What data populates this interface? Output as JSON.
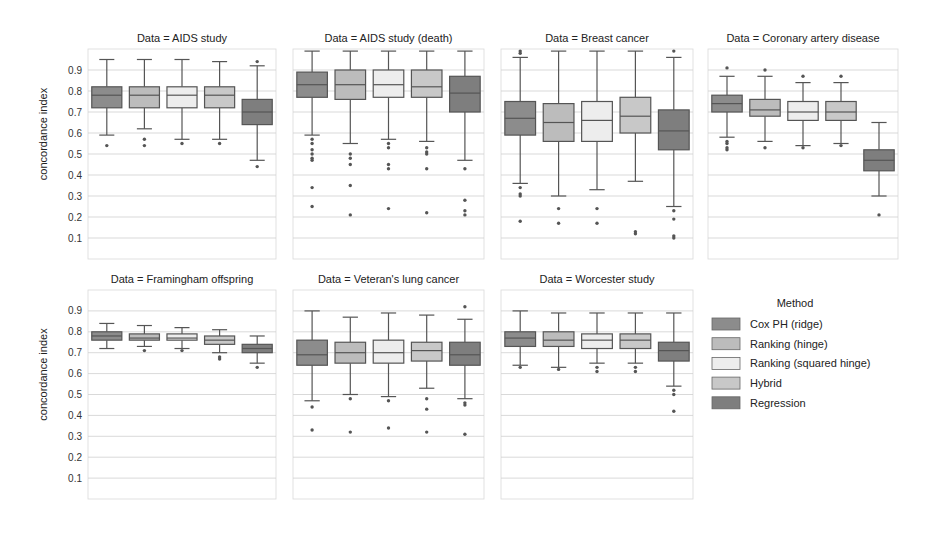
{
  "chart_data": {
    "type": "box",
    "ylabel": "concordance index",
    "ylim": [
      0.0,
      1.0
    ],
    "yticks": [
      0.1,
      0.2,
      0.3,
      0.4,
      0.5,
      0.6,
      0.7,
      0.8,
      0.9
    ],
    "ytick_labels": [
      "0.1",
      "0.2",
      "0.3",
      "0.4",
      "0.5",
      "0.6",
      "0.7",
      "0.8",
      "0.9"
    ],
    "grid": true,
    "legend": {
      "title": "Method",
      "placement": "right",
      "entries": [
        {
          "name": "Cox PH (ridge)",
          "color": "#8c8c8c"
        },
        {
          "name": "Ranking (hinge)",
          "color": "#bcbcbc"
        },
        {
          "name": "Ranking (squared hinge)",
          "color": "#ededed"
        },
        {
          "name": "Hybrid",
          "color": "#c8c8c8"
        },
        {
          "name": "Regression",
          "color": "#7e7e7e"
        }
      ]
    },
    "panels": [
      {
        "title": "Data = AIDS study",
        "boxes": [
          {
            "method": "Cox PH (ridge)",
            "whislo": 0.59,
            "q1": 0.72,
            "med": 0.78,
            "q3": 0.82,
            "whishi": 0.95,
            "fliers": [
              0.54
            ]
          },
          {
            "method": "Ranking (hinge)",
            "whislo": 0.62,
            "q1": 0.72,
            "med": 0.78,
            "q3": 0.82,
            "whishi": 0.95,
            "fliers": [
              0.57,
              0.54
            ]
          },
          {
            "method": "Ranking (squared hinge)",
            "whislo": 0.57,
            "q1": 0.72,
            "med": 0.78,
            "q3": 0.82,
            "whishi": 0.95,
            "fliers": [
              0.55
            ]
          },
          {
            "method": "Hybrid",
            "whislo": 0.57,
            "q1": 0.72,
            "med": 0.78,
            "q3": 0.82,
            "whishi": 0.94,
            "fliers": [
              0.55
            ]
          },
          {
            "method": "Regression",
            "whislo": 0.47,
            "q1": 0.64,
            "med": 0.7,
            "q3": 0.76,
            "whishi": 0.92,
            "fliers": [
              0.94,
              0.44
            ]
          }
        ]
      },
      {
        "title": "Data = AIDS study (death)",
        "boxes": [
          {
            "method": "Cox PH (ridge)",
            "whislo": 0.59,
            "q1": 0.77,
            "med": 0.83,
            "q3": 0.89,
            "whishi": 0.99,
            "fliers": [
              0.57,
              0.55,
              0.52,
              0.5,
              0.48,
              0.47,
              0.34,
              0.25
            ]
          },
          {
            "method": "Ranking (hinge)",
            "whislo": 0.55,
            "q1": 0.76,
            "med": 0.83,
            "q3": 0.9,
            "whishi": 0.99,
            "fliers": [
              0.5,
              0.48,
              0.45,
              0.35,
              0.21
            ]
          },
          {
            "method": "Ranking (squared hinge)",
            "whislo": 0.57,
            "q1": 0.77,
            "med": 0.83,
            "q3": 0.9,
            "whishi": 0.99,
            "fliers": [
              0.55,
              0.53,
              0.45,
              0.43,
              0.24
            ]
          },
          {
            "method": "Hybrid",
            "whislo": 0.56,
            "q1": 0.77,
            "med": 0.82,
            "q3": 0.9,
            "whishi": 0.99,
            "fliers": [
              0.53,
              0.51,
              0.5,
              0.43,
              0.22
            ]
          },
          {
            "method": "Regression",
            "whislo": 0.47,
            "q1": 0.7,
            "med": 0.79,
            "q3": 0.87,
            "whishi": 0.99,
            "fliers": [
              0.43,
              0.28,
              0.23,
              0.21
            ]
          }
        ]
      },
      {
        "title": "Data = Breast cancer",
        "boxes": [
          {
            "method": "Cox PH (ridge)",
            "whislo": 0.36,
            "q1": 0.59,
            "med": 0.67,
            "q3": 0.75,
            "whishi": 0.96,
            "fliers": [
              0.99,
              0.98,
              0.34,
              0.31,
              0.3,
              0.18
            ]
          },
          {
            "method": "Ranking (hinge)",
            "whislo": 0.3,
            "q1": 0.56,
            "med": 0.65,
            "q3": 0.74,
            "whishi": 0.99,
            "fliers": [
              0.24,
              0.17
            ]
          },
          {
            "method": "Ranking (squared hinge)",
            "whislo": 0.33,
            "q1": 0.56,
            "med": 0.66,
            "q3": 0.75,
            "whishi": 0.99,
            "fliers": [
              0.24,
              0.17
            ]
          },
          {
            "method": "Hybrid",
            "whislo": 0.37,
            "q1": 0.6,
            "med": 0.68,
            "q3": 0.77,
            "whishi": 0.99,
            "fliers": [
              0.13,
              0.12
            ]
          },
          {
            "method": "Regression",
            "whislo": 0.25,
            "q1": 0.52,
            "med": 0.61,
            "q3": 0.71,
            "whishi": 0.96,
            "fliers": [
              0.99,
              0.23,
              0.19,
              0.11,
              0.1
            ]
          }
        ]
      },
      {
        "title": "Data = Coronary artery disease",
        "boxes": [
          {
            "method": "Cox PH (ridge)",
            "whislo": 0.58,
            "q1": 0.7,
            "med": 0.74,
            "q3": 0.78,
            "whishi": 0.87,
            "fliers": [
              0.91,
              0.56,
              0.55,
              0.53,
              0.52
            ]
          },
          {
            "method": "Ranking (hinge)",
            "whislo": 0.56,
            "q1": 0.68,
            "med": 0.71,
            "q3": 0.76,
            "whishi": 0.87,
            "fliers": [
              0.9,
              0.53
            ]
          },
          {
            "method": "Ranking (squared hinge)",
            "whislo": 0.54,
            "q1": 0.66,
            "med": 0.7,
            "q3": 0.75,
            "whishi": 0.84,
            "fliers": [
              0.87,
              0.53
            ]
          },
          {
            "method": "Hybrid",
            "whislo": 0.55,
            "q1": 0.66,
            "med": 0.7,
            "q3": 0.75,
            "whishi": 0.84,
            "fliers": [
              0.87,
              0.54
            ]
          },
          {
            "method": "Regression",
            "whislo": 0.3,
            "q1": 0.42,
            "med": 0.47,
            "q3": 0.52,
            "whishi": 0.65,
            "fliers": [
              0.21
            ]
          }
        ]
      },
      {
        "title": "Data = Framingham offspring",
        "boxes": [
          {
            "method": "Cox PH (ridge)",
            "whislo": 0.72,
            "q1": 0.76,
            "med": 0.78,
            "q3": 0.8,
            "whishi": 0.84,
            "fliers": []
          },
          {
            "method": "Ranking (hinge)",
            "whislo": 0.73,
            "q1": 0.76,
            "med": 0.77,
            "q3": 0.79,
            "whishi": 0.83,
            "fliers": [
              0.71
            ]
          },
          {
            "method": "Ranking (squared hinge)",
            "whislo": 0.72,
            "q1": 0.76,
            "med": 0.77,
            "q3": 0.79,
            "whishi": 0.82,
            "fliers": [
              0.71
            ]
          },
          {
            "method": "Hybrid",
            "whislo": 0.7,
            "q1": 0.74,
            "med": 0.76,
            "q3": 0.78,
            "whishi": 0.81,
            "fliers": [
              0.68,
              0.67
            ]
          },
          {
            "method": "Regression",
            "whislo": 0.65,
            "q1": 0.7,
            "med": 0.72,
            "q3": 0.74,
            "whishi": 0.78,
            "fliers": [
              0.63
            ]
          }
        ]
      },
      {
        "title": "Data = Veteran's lung cancer",
        "boxes": [
          {
            "method": "Cox PH (ridge)",
            "whislo": 0.47,
            "q1": 0.64,
            "med": 0.69,
            "q3": 0.76,
            "whishi": 0.9,
            "fliers": [
              0.44,
              0.33
            ]
          },
          {
            "method": "Ranking (hinge)",
            "whislo": 0.5,
            "q1": 0.65,
            "med": 0.7,
            "q3": 0.75,
            "whishi": 0.87,
            "fliers": [
              0.48,
              0.32
            ]
          },
          {
            "method": "Ranking (squared hinge)",
            "whislo": 0.49,
            "q1": 0.65,
            "med": 0.7,
            "q3": 0.76,
            "whishi": 0.89,
            "fliers": [
              0.47,
              0.34
            ]
          },
          {
            "method": "Hybrid",
            "whislo": 0.53,
            "q1": 0.66,
            "med": 0.71,
            "q3": 0.75,
            "whishi": 0.88,
            "fliers": [
              0.48,
              0.43,
              0.32
            ]
          },
          {
            "method": "Regression",
            "whislo": 0.48,
            "q1": 0.64,
            "med": 0.69,
            "q3": 0.75,
            "whishi": 0.86,
            "fliers": [
              0.92,
              0.46,
              0.45,
              0.31
            ]
          }
        ]
      },
      {
        "title": "Data = Worcester study",
        "boxes": [
          {
            "method": "Cox PH (ridge)",
            "whislo": 0.64,
            "q1": 0.73,
            "med": 0.77,
            "q3": 0.8,
            "whishi": 0.9,
            "fliers": [
              0.63
            ]
          },
          {
            "method": "Ranking (hinge)",
            "whislo": 0.63,
            "q1": 0.73,
            "med": 0.76,
            "q3": 0.8,
            "whishi": 0.89,
            "fliers": [
              0.62
            ]
          },
          {
            "method": "Ranking (squared hinge)",
            "whislo": 0.65,
            "q1": 0.72,
            "med": 0.76,
            "q3": 0.79,
            "whishi": 0.89,
            "fliers": [
              0.63,
              0.61
            ]
          },
          {
            "method": "Hybrid",
            "whislo": 0.65,
            "q1": 0.72,
            "med": 0.76,
            "q3": 0.79,
            "whishi": 0.89,
            "fliers": [
              0.63,
              0.61
            ]
          },
          {
            "method": "Regression",
            "whislo": 0.54,
            "q1": 0.66,
            "med": 0.71,
            "q3": 0.75,
            "whishi": 0.89,
            "fliers": [
              0.52,
              0.5,
              0.42
            ]
          }
        ]
      }
    ]
  }
}
